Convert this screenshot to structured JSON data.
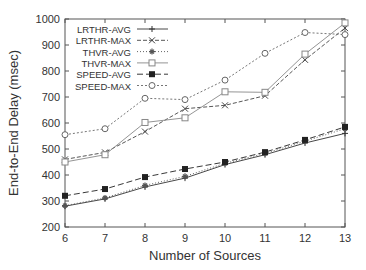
{
  "chart_data": {
    "type": "line",
    "title": "",
    "xlabel": "Number of Sources",
    "ylabel": "End-to-End Delay (msec)",
    "x": [
      6,
      7,
      8,
      9,
      10,
      11,
      12,
      13
    ],
    "xlim": [
      6,
      13
    ],
    "ylim": [
      200,
      1000
    ],
    "yticks": [
      200,
      300,
      400,
      500,
      600,
      700,
      800,
      900,
      1000
    ],
    "xticks": [
      6,
      7,
      8,
      9,
      10,
      11,
      12,
      13
    ],
    "grid": false,
    "legend_position": "upper left (inside)",
    "series": [
      {
        "name": "LRTHR-AVG",
        "marker": "plus",
        "dash": "",
        "color": "#333333",
        "values": [
          280,
          308,
          354,
          388,
          440,
          478,
          523,
          560
        ]
      },
      {
        "name": "LRTHR-MAX",
        "marker": "cross",
        "dash": "4,2",
        "color": "#444444",
        "values": [
          460,
          487,
          567,
          655,
          668,
          705,
          843,
          965
        ]
      },
      {
        "name": "THVR-AVG",
        "marker": "star",
        "dash": "1,2",
        "color": "#555555",
        "values": [
          282,
          312,
          360,
          395,
          445,
          483,
          530,
          578
        ]
      },
      {
        "name": "THVR-MAX",
        "marker": "square-open",
        "dash": "",
        "color": "#888888",
        "values": [
          450,
          478,
          602,
          620,
          720,
          718,
          865,
          985
        ]
      },
      {
        "name": "SPEED-AVG",
        "marker": "square-filled",
        "dash": "6,3",
        "color": "#222222",
        "values": [
          320,
          346,
          392,
          423,
          450,
          488,
          535,
          585
        ]
      },
      {
        "name": "SPEED-MAX",
        "marker": "circle-open",
        "dash": "2,2",
        "color": "#666666",
        "values": [
          555,
          578,
          695,
          690,
          765,
          868,
          948,
          940
        ]
      }
    ]
  }
}
